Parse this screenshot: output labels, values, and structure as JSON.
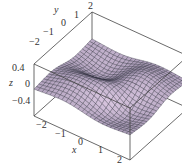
{
  "chart_data": {
    "type": "surface3d",
    "title": "",
    "xlabel": "x",
    "ylabel": "y",
    "zlabel": "z",
    "xlim": [
      -2,
      2
    ],
    "ylim": [
      -2,
      2
    ],
    "zlim": [
      -0.4,
      0.4
    ],
    "x_ticks": [
      "-2",
      "-1",
      "0",
      "1",
      "2"
    ],
    "y_ticks": [
      "-2",
      "-1",
      "0",
      "1",
      "2"
    ],
    "z_ticks": [
      "0.4",
      "0",
      "-0.4"
    ],
    "grid_resolution": 24,
    "surface_color": "#b7a9c0",
    "mesh_color": "#2e2d3e",
    "box_color": "#444444"
  },
  "labels": {
    "z_axis": "z",
    "y_axis": "y",
    "x_axis": "x",
    "z_ticks": [
      "0.4",
      "0",
      "−0.4"
    ],
    "y_ticks": [
      "−2",
      "−1",
      "0",
      "1",
      "2"
    ],
    "x_ticks": [
      "−2",
      "−1",
      "0",
      "1",
      "2"
    ]
  }
}
